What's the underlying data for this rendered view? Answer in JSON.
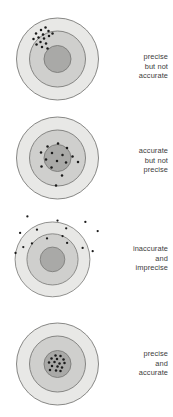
{
  "figure": {
    "background_color": "#ffffff"
  },
  "style": {
    "ring_outer_fill": "#e8e8e6",
    "ring_middle_fill": "#cfcfcd",
    "ring_inner_fill": "#a9a9a7",
    "ring_stroke": "#7a7a78",
    "dot_color": "#1b1b1b",
    "text_color": "#3b3b3b"
  },
  "panels": [
    {
      "id": "precise-not-accurate",
      "caption_lines": [
        "precise",
        "but not",
        "accurate"
      ],
      "target": {
        "cx": 57.5,
        "cy": 59.0,
        "r_outer": 41.0,
        "r_middle": 28.0,
        "r_inner": 13.5
      },
      "dots": [
        {
          "x": 36.0,
          "y": 33.5
        },
        {
          "x": 41.0,
          "y": 30.0
        },
        {
          "x": 45.5,
          "y": 27.5
        },
        {
          "x": 48.5,
          "y": 31.0
        },
        {
          "x": 43.0,
          "y": 34.5
        },
        {
          "x": 38.5,
          "y": 37.5
        },
        {
          "x": 33.5,
          "y": 39.0
        },
        {
          "x": 44.0,
          "y": 38.5
        },
        {
          "x": 49.0,
          "y": 36.0
        },
        {
          "x": 52.5,
          "y": 33.5
        },
        {
          "x": 40.5,
          "y": 42.0
        },
        {
          "x": 46.0,
          "y": 43.5
        },
        {
          "x": 36.5,
          "y": 44.5
        },
        {
          "x": 42.0,
          "y": 47.0
        },
        {
          "x": 47.5,
          "y": 48.5
        }
      ]
    },
    {
      "id": "accurate-not-precise",
      "caption_lines": [
        "accurate",
        "but not",
        "precise"
      ],
      "target": {
        "cx": 57.5,
        "cy": 59.0,
        "r_outer": 41.0,
        "r_middle": 28.0,
        "r_inner": 13.5
      },
      "dots": [
        {
          "x": 58.0,
          "y": 44.5
        },
        {
          "x": 47.5,
          "y": 47.5
        },
        {
          "x": 67.0,
          "y": 49.0
        },
        {
          "x": 41.0,
          "y": 53.5
        },
        {
          "x": 52.0,
          "y": 54.0
        },
        {
          "x": 62.5,
          "y": 56.0
        },
        {
          "x": 72.5,
          "y": 57.5
        },
        {
          "x": 46.0,
          "y": 60.5
        },
        {
          "x": 57.0,
          "y": 62.0
        },
        {
          "x": 66.0,
          "y": 63.5
        },
        {
          "x": 41.5,
          "y": 67.5
        },
        {
          "x": 51.5,
          "y": 68.5
        },
        {
          "x": 78.0,
          "y": 63.0
        },
        {
          "x": 62.0,
          "y": 76.5
        },
        {
          "x": 56.0,
          "y": 86.5
        }
      ]
    },
    {
      "id": "inaccurate-and-imprecise",
      "caption_lines": [
        "inaccurate",
        "and",
        "imprecise"
      ],
      "target": {
        "cx": 57.5,
        "cy": 59.0,
        "r_outer": 41.0,
        "r_middle": 28.0,
        "r_inner": 13.5
      },
      "dots": [
        {
          "x": 30.0,
          "y": 12.0
        },
        {
          "x": 63.0,
          "y": 16.5
        },
        {
          "x": 93.5,
          "y": 18.0
        },
        {
          "x": 22.0,
          "y": 30.0
        },
        {
          "x": 40.5,
          "y": 26.5
        },
        {
          "x": 72.5,
          "y": 25.0
        },
        {
          "x": 107.0,
          "y": 28.0
        },
        {
          "x": 51.5,
          "y": 36.0
        },
        {
          "x": 68.5,
          "y": 33.5
        },
        {
          "x": 35.0,
          "y": 41.5
        },
        {
          "x": 73.5,
          "y": 41.0
        },
        {
          "x": 25.5,
          "y": 45.5
        },
        {
          "x": 90.5,
          "y": 46.5
        },
        {
          "x": 17.0,
          "y": 52.0
        },
        {
          "x": 101.5,
          "y": 50.0
        }
      ]
    },
    {
      "id": "precise-and-accurate",
      "caption_lines": [
        "precise",
        "and",
        "accurate"
      ],
      "target": {
        "cx": 57.5,
        "cy": 59.0,
        "r_outer": 41.0,
        "r_middle": 28.0,
        "r_inner": 13.5
      },
      "dots": [
        {
          "x": 55.5,
          "y": 50.5
        },
        {
          "x": 60.5,
          "y": 51.0
        },
        {
          "x": 51.5,
          "y": 53.5
        },
        {
          "x": 57.0,
          "y": 54.0
        },
        {
          "x": 63.5,
          "y": 54.5
        },
        {
          "x": 49.0,
          "y": 57.5
        },
        {
          "x": 54.5,
          "y": 57.0
        },
        {
          "x": 59.5,
          "y": 58.5
        },
        {
          "x": 64.5,
          "y": 58.0
        },
        {
          "x": 52.0,
          "y": 61.0
        },
        {
          "x": 57.5,
          "y": 61.5
        },
        {
          "x": 62.0,
          "y": 62.5
        },
        {
          "x": 50.0,
          "y": 65.0
        },
        {
          "x": 56.0,
          "y": 65.5
        },
        {
          "x": 60.5,
          "y": 66.0
        }
      ]
    }
  ]
}
